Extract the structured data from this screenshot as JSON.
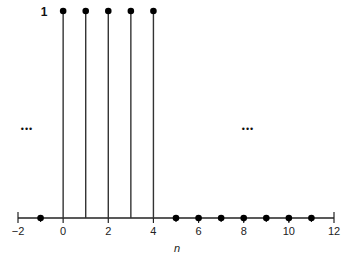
{
  "chart_data": {
    "type": "stem",
    "title": "",
    "xlabel": "n",
    "ylabel": "",
    "x": [
      -1,
      0,
      1,
      2,
      3,
      4,
      5,
      6,
      7,
      8,
      9,
      10,
      11
    ],
    "values": [
      0,
      1,
      1,
      1,
      1,
      1,
      0,
      0,
      0,
      0,
      0,
      0,
      0
    ],
    "xlim": [
      -2,
      12
    ],
    "ylim": [
      0,
      1
    ],
    "x_ticks": [
      -2,
      0,
      2,
      4,
      6,
      8,
      10,
      12
    ],
    "x_tick_labels": [
      "−2",
      "0",
      "2",
      "4",
      "6",
      "8",
      "10",
      "12"
    ],
    "y_value_label": "1",
    "annotations": [
      "...",
      "..."
    ],
    "grid": false,
    "legend": null
  },
  "labels": {
    "xlabel": "n",
    "y_value_label": "1",
    "ellipsis_left": "•••",
    "ellipsis_right": "•••"
  }
}
